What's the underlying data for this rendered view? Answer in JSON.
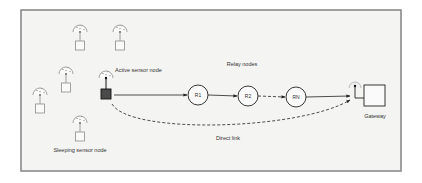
{
  "diagram": {
    "frame": {
      "x": 21,
      "y": 10,
      "w": 380,
      "h": 161,
      "fill": "#f4f4f2",
      "stroke": "#8a8a8a"
    },
    "colors": {
      "line": "#222222",
      "sensor": "#8c8c8c",
      "active_fill": "#4a4a4a"
    },
    "labels": {
      "active_sensor": "Active sensor node",
      "sleeping_sensor": "Sleeping sensor node",
      "relay_nodes": "Relay nodes",
      "gateway": "Gateway",
      "direct_link": "Direct link"
    },
    "sleeping_sensors": [
      {
        "x": 80,
        "y": 30
      },
      {
        "x": 120,
        "y": 30
      },
      {
        "x": 66,
        "y": 72
      },
      {
        "x": 40,
        "y": 93
      },
      {
        "x": 80,
        "y": 121
      }
    ],
    "active_sensor": {
      "x": 106,
      "y": 76
    },
    "relays": [
      {
        "id": "R1",
        "x": 198,
        "y": 95
      },
      {
        "id": "R2",
        "x": 248,
        "y": 96
      },
      {
        "id": "RN",
        "x": 296,
        "y": 97
      }
    ],
    "gateway": {
      "x": 355,
      "y": 83
    }
  }
}
